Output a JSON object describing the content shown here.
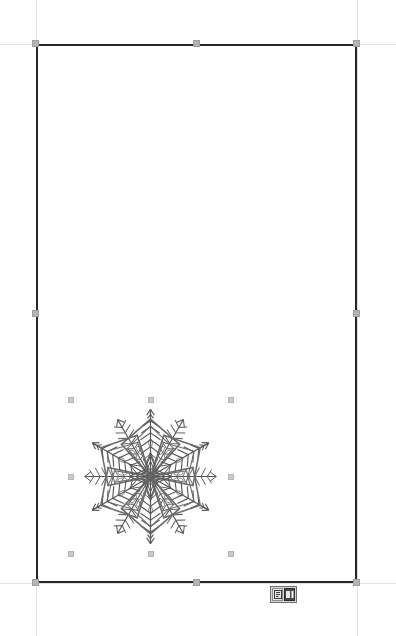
{
  "document": {
    "title": "Untitled Document",
    "page": {
      "label": "Page",
      "selected": true,
      "border_color": "#272727",
      "fill_color": "#ffffff",
      "x": 36,
      "y": 44,
      "width": 321,
      "height": 539
    }
  },
  "guides": {
    "color": "#e2e2e2",
    "vertical": [
      36,
      357
    ],
    "horizontal": [
      44,
      583
    ]
  },
  "selection": {
    "handle_color": "#bdbdbd",
    "page_handles": [
      {
        "name": "handle-top-left",
        "x": 32,
        "y": 40
      },
      {
        "name": "handle-top-center",
        "x": 193,
        "y": 40
      },
      {
        "name": "handle-top-right",
        "x": 353,
        "y": 40
      },
      {
        "name": "handle-middle-left",
        "x": 32,
        "y": 310
      },
      {
        "name": "handle-middle-right",
        "x": 353,
        "y": 310
      },
      {
        "name": "handle-bottom-left",
        "x": 32,
        "y": 579
      },
      {
        "name": "handle-bottom-center",
        "x": 193,
        "y": 579
      },
      {
        "name": "handle-bottom-right",
        "x": 353,
        "y": 579
      }
    ],
    "image_handles": [
      {
        "name": "img-handle-top-left",
        "x": 68,
        "y": 397
      },
      {
        "name": "img-handle-top-center",
        "x": 148,
        "y": 397
      },
      {
        "name": "img-handle-top-right",
        "x": 228,
        "y": 397
      },
      {
        "name": "img-handle-middle-left",
        "x": 68,
        "y": 474
      },
      {
        "name": "img-handle-middle-right",
        "x": 228,
        "y": 474
      },
      {
        "name": "img-handle-bottom-left",
        "x": 68,
        "y": 551
      },
      {
        "name": "img-handle-bottom-center",
        "x": 148,
        "y": 551
      },
      {
        "name": "img-handle-bottom-right",
        "x": 228,
        "y": 551
      }
    ]
  },
  "image_object": {
    "name": "snowflake-clipart",
    "alt": "Six-pointed decorative snowflake line art",
    "selected": true,
    "stroke_color": "#555555",
    "x": 71,
    "y": 400,
    "width": 159,
    "height": 153,
    "points": 6
  },
  "mini_toolbar": {
    "name": "floating-object-toolbar",
    "buttons": [
      {
        "name": "text-wrap-button",
        "icon": "text-wrap-icon",
        "label": "Wrap Text",
        "active": false
      },
      {
        "name": "anchor-page-button",
        "icon": "anchor-page-icon",
        "label": "To Page",
        "active": true
      }
    ]
  }
}
